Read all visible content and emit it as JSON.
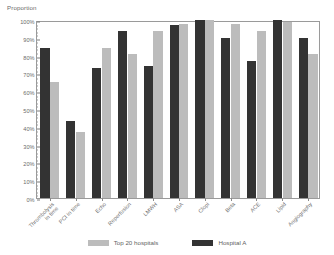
{
  "chart_data": {
    "type": "bar",
    "title": "",
    "xlabel": "",
    "ylabel": "Proportion",
    "ylim": [
      0,
      100
    ],
    "grid": false,
    "legend_position": "bottom",
    "y_ticks": [
      "0%",
      "10%",
      "20%",
      "30%",
      "40%",
      "50%",
      "60%",
      "70%",
      "80%",
      "90%",
      "100%"
    ],
    "y_tick_values": [
      0,
      10,
      20,
      30,
      40,
      50,
      60,
      70,
      80,
      90,
      100
    ],
    "categories": [
      "Thrombolysis in time",
      "PCI in time",
      "Echo",
      "Reperfusion",
      "LMWH",
      "ASA",
      "Clopi",
      "Beta",
      "ACE",
      "Lipid",
      "Angiography"
    ],
    "category_lines": [
      [
        "Thrombolysis",
        "in time"
      ],
      [
        "PCI in time"
      ],
      [
        "Echo"
      ],
      [
        "Reperfusion"
      ],
      [
        "LMWH"
      ],
      [
        "ASA"
      ],
      [
        "Clopi"
      ],
      [
        "Beta"
      ],
      [
        "ACE"
      ],
      [
        "Lipid"
      ],
      [
        "Angiography"
      ]
    ],
    "series": [
      {
        "name": "Hospital A",
        "color": "#333333",
        "values": [
          84,
          43,
          73,
          94,
          74,
          97,
          101,
          90,
          77,
          101,
          90
        ]
      },
      {
        "name": "Top 20 hospitals",
        "color": "#bcbcbc",
        "values": [
          65,
          37,
          84,
          81,
          94,
          98,
          101,
          98,
          94,
          99,
          81
        ]
      }
    ],
    "legend": [
      {
        "label": "Top 20 hospitals",
        "color": "#bcbcbc"
      },
      {
        "label": "Hospital A",
        "color": "#333333"
      }
    ]
  }
}
